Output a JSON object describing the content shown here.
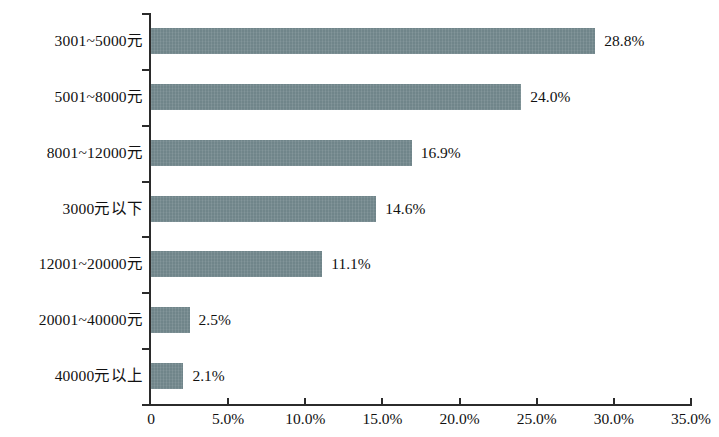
{
  "chart_data": {
    "type": "bar",
    "orientation": "horizontal",
    "title": "",
    "xlabel": "",
    "ylabel": "",
    "categories": [
      "3001~5000元",
      "5001~8000元",
      "8001~12000元",
      "3000元以下",
      "12001~20000元",
      "20001~40000元",
      "40000元以上"
    ],
    "values": [
      28.8,
      24.0,
      16.9,
      14.6,
      11.1,
      2.5,
      2.1
    ],
    "data_labels": [
      "28.8%",
      "24.0%",
      "16.9%",
      "14.6%",
      "11.1%",
      "2.5%",
      "2.1%"
    ],
    "xlim": [
      0,
      35
    ],
    "x_tick_values": [
      0,
      5,
      10,
      15,
      20,
      25,
      30,
      35
    ],
    "x_tick_labels": [
      "0",
      "5.0%",
      "10.0%",
      "15.0%",
      "20.0%",
      "25.0%",
      "30.0%",
      "35.0%"
    ],
    "grid": false,
    "legend": false,
    "bar_color": "#70858a",
    "axis_color": "#2b2b2b",
    "text_color": "#111111"
  }
}
